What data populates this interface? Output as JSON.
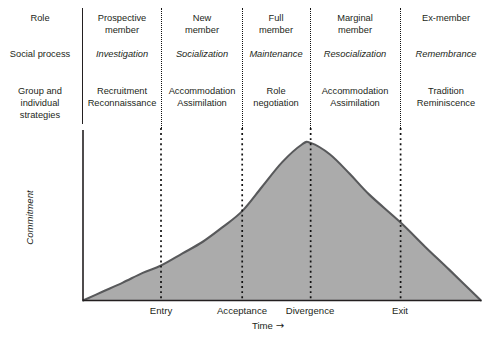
{
  "matrix": {
    "row_labels": [
      "Role",
      "Social process",
      "Group and\nindividual\nstrategies"
    ],
    "row_labels_flat": {
      "role": "Role",
      "social_process": "Social process",
      "group_strategies_l1": "Group and",
      "group_strategies_l2": "individual",
      "group_strategies_l3": "strategies"
    },
    "columns": [
      {
        "role_l1": "Prospective",
        "role_l2": "member",
        "social_process": "Investigation",
        "strategies_l1": "Recruitment",
        "strategies_l2": "Reconnaissance"
      },
      {
        "role_l1": "New",
        "role_l2": "member",
        "social_process": "Socialization",
        "strategies_l1": "Accommodation",
        "strategies_l2": "Assimilation"
      },
      {
        "role_l1": "Full",
        "role_l2": "member",
        "social_process": "Maintenance",
        "strategies_l1": "Role",
        "strategies_l2": "negotiation"
      },
      {
        "role_l1": "Marginal",
        "role_l2": "member",
        "social_process": "Resocialization",
        "strategies_l1": "Accommodation",
        "strategies_l2": "Assimilation"
      },
      {
        "role_l1": "Ex-member",
        "role_l2": "",
        "social_process": "Remembrance",
        "strategies_l1": "Tradition",
        "strategies_l2": "Reminiscence"
      }
    ]
  },
  "chart_data": {
    "type": "area",
    "title": "",
    "xlabel": "Time",
    "xlabel_arrow": "→",
    "ylabel": "Commitment",
    "grid": false,
    "legend": "none",
    "xlim": [
      0,
      100
    ],
    "ylim": [
      0,
      100
    ],
    "tick_labels": [
      "Entry",
      "Acceptance",
      "Divergence",
      "Exit"
    ],
    "tick_x": [
      19.6,
      40.0,
      57.2,
      79.8
    ],
    "fill_color": "#ababab",
    "line_color": "#58595b",
    "x": [
      0,
      5,
      10,
      15,
      19.6,
      25,
      30,
      35,
      40,
      45,
      50,
      55,
      57.2,
      62,
      67,
      72,
      79.8,
      86,
      92,
      100
    ],
    "y": [
      0,
      5.5,
      11,
      17,
      21.5,
      29,
      36,
      45,
      55,
      70,
      85,
      96,
      97,
      90,
      78,
      65,
      48,
      33,
      19,
      0
    ]
  },
  "colors": {
    "fill": "#ababab",
    "stroke": "#58595b",
    "text": "#231f20",
    "divider": "#111111"
  }
}
